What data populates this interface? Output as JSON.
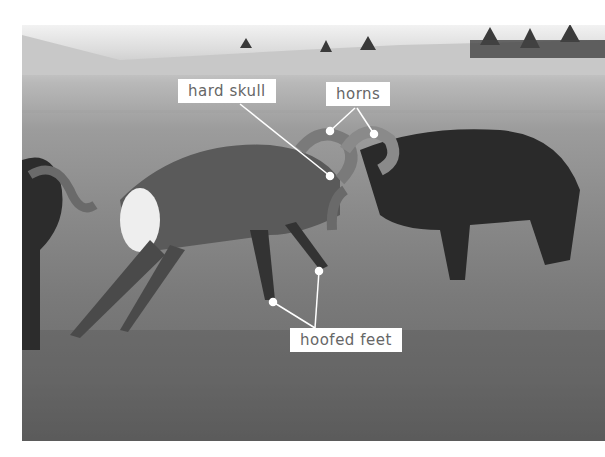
{
  "image": {
    "description": "Two bighorn rams clashing heads on a grassy hillside, a third ram partially visible at left",
    "labels": [
      {
        "id": "hard-skull",
        "text": "hard skull"
      },
      {
        "id": "horns",
        "text": "horns"
      },
      {
        "id": "hoofed-feet",
        "text": "hoofed feet"
      }
    ]
  }
}
